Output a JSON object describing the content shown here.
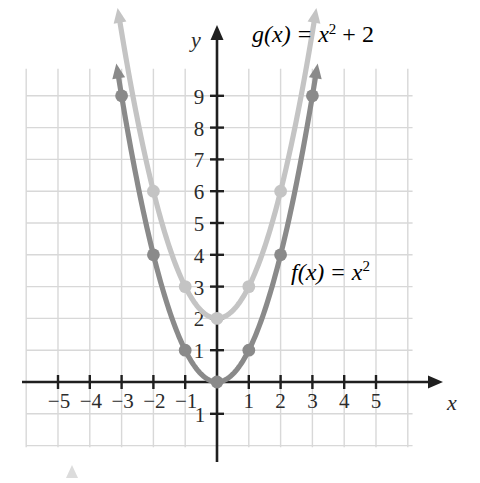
{
  "figure": {
    "background": "#ffffff",
    "grid_color": "#d8d8d8",
    "axis_color": "#1f1f1f",
    "x_axis_label": "x",
    "y_axis_label": "y"
  },
  "labels": {
    "f_name": "f(x)",
    "f_equals": "=",
    "f_base": "x",
    "f_exp": "2",
    "f_full": "f(x) = x²",
    "f_color": "#8a8a8a",
    "g_name": "g(x)",
    "g_equals": "=",
    "g_base": "x",
    "g_exp": "2",
    "g_plus": "+ 2",
    "g_full": "g(x) = x² + 2",
    "g_color": "#c4c4c4"
  },
  "axes": {
    "x_ticks": [
      -5,
      -4,
      -3,
      -2,
      -1,
      1,
      2,
      3,
      4,
      5
    ],
    "x_tick_labels": [
      "−5",
      "−4",
      "−3",
      "−2",
      "−1",
      "1",
      "2",
      "3",
      "4",
      "5"
    ],
    "y_ticks": [
      -1,
      1,
      2,
      3,
      4,
      5,
      6,
      7,
      8,
      9
    ],
    "y_tick_labels": [
      "−1",
      "1",
      "2",
      "3",
      "4",
      "5",
      "6",
      "7",
      "8",
      "9"
    ],
    "xlim": [
      -6,
      6
    ],
    "ylim": [
      -2,
      10
    ],
    "grid": true
  },
  "chart_data": {
    "type": "line",
    "title": "",
    "xlabel": "x",
    "ylabel": "y",
    "xlim": [
      -6,
      6
    ],
    "ylim": [
      -2,
      10
    ],
    "grid": true,
    "legend": "inline-annotations",
    "series": [
      {
        "name": "f(x) = x²",
        "color": "#8a8a8a",
        "style": "parabola-with-arrows",
        "points": [
          {
            "x": -3,
            "y": 9
          },
          {
            "x": -2,
            "y": 4
          },
          {
            "x": -1,
            "y": 1
          },
          {
            "x": 0,
            "y": 0
          },
          {
            "x": 1,
            "y": 1
          },
          {
            "x": 2,
            "y": 4
          },
          {
            "x": 3,
            "y": 9
          }
        ],
        "marked_points": [
          [
            -3,
            9
          ],
          [
            -2,
            4
          ],
          [
            -1,
            1
          ],
          [
            0,
            0
          ],
          [
            1,
            1
          ],
          [
            2,
            4
          ],
          [
            3,
            9
          ]
        ]
      },
      {
        "name": "g(x) = x² + 2",
        "color": "#c4c4c4",
        "style": "parabola-with-arrows",
        "points": [
          {
            "x": -3,
            "y": 11
          },
          {
            "x": -2,
            "y": 6
          },
          {
            "x": -1,
            "y": 3
          },
          {
            "x": 0,
            "y": 2
          },
          {
            "x": 1,
            "y": 3
          },
          {
            "x": 2,
            "y": 6
          },
          {
            "x": 3,
            "y": 11
          }
        ],
        "marked_points": [
          [
            -2,
            6
          ],
          [
            -1,
            3
          ],
          [
            0,
            2
          ],
          [
            1,
            3
          ],
          [
            2,
            6
          ]
        ]
      }
    ]
  },
  "footer": {
    "marker": "triangle-marker"
  }
}
